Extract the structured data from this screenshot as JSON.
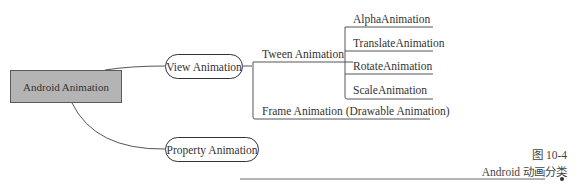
{
  "root": {
    "label": "Android Animation",
    "fill": "#b4b4b4"
  },
  "branches": {
    "view": {
      "label": "View Animation"
    },
    "property": {
      "label": "Property Animation"
    }
  },
  "view_children": {
    "tween": {
      "label": "Tween Animation"
    },
    "frame": {
      "label": "Frame Animation (Drawable Animation)"
    }
  },
  "tween_children": [
    {
      "label": "AlphaAnimation"
    },
    {
      "label": "TranslateAnimation"
    },
    {
      "label": "RotateAnimation"
    },
    {
      "label": "ScaleAnimation"
    }
  ],
  "caption": {
    "figure_number": "图 10-4",
    "title": "Android 动画分类"
  }
}
